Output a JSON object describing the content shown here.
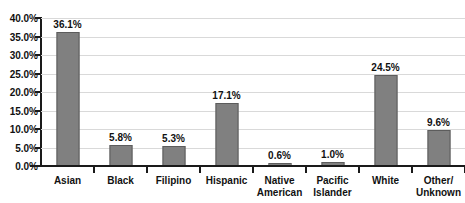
{
  "chart_data": {
    "type": "bar",
    "title": "Ethnicity of Students",
    "title_clipped": true,
    "xlabel": "",
    "ylabel": "",
    "ylim": [
      0,
      40
    ],
    "ytick_step": 5,
    "grid": true,
    "legend": "none",
    "orientation": "vertical",
    "series_color": "#808080",
    "categories": [
      "Asian",
      "Black",
      "Filipino",
      "Hispanic",
      "Native American",
      "Pacific Islander",
      "White",
      "Other/ Unknown"
    ],
    "category_lines": [
      [
        "Asian"
      ],
      [
        "Black"
      ],
      [
        "Filipino"
      ],
      [
        "Hispanic"
      ],
      [
        "Native",
        "American"
      ],
      [
        "Pacific",
        "Islander"
      ],
      [
        "White"
      ],
      [
        "Other/",
        "Unknown"
      ]
    ],
    "values": [
      36.1,
      5.8,
      5.3,
      17.1,
      0.6,
      1.0,
      24.5,
      9.6
    ],
    "value_labels": [
      "36.1%",
      "5.8%",
      "5.3%",
      "17.1%",
      "0.6%",
      "1.0%",
      "24.5%",
      "9.6%"
    ],
    "ytick_labels": [
      "40.0%",
      "35.0%",
      "30.0%",
      "25.0%",
      "20.0%",
      "15.0%",
      "10.0%",
      "5.0%",
      "0.0%"
    ],
    "ytick_values": [
      40,
      35,
      30,
      25,
      20,
      15,
      10,
      5,
      0
    ]
  },
  "colors": {
    "bar_fill": "#808080",
    "bar_border": "#5c5c5c",
    "gridline": "#d9d9d9",
    "axis": "#1a1a1a",
    "text": "#111111",
    "background": "#ffffff"
  }
}
